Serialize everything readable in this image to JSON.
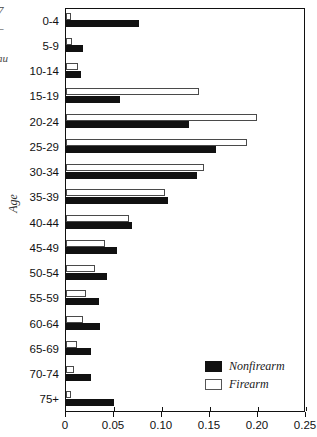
{
  "chart_data": {
    "type": "bar",
    "orientation": "horizontal",
    "title": "",
    "xlabel": "",
    "ylabel": "Age",
    "xlim": [
      0,
      0.25
    ],
    "xticks": [
      "0",
      "0.05",
      "0.10",
      "0.15",
      "0.20",
      "0.25"
    ],
    "xtick_values": [
      0,
      0.05,
      0.1,
      0.15,
      0.2,
      0.25
    ],
    "grid": false,
    "legend_position": "bottom-right",
    "categories": [
      "0-4",
      "5-9",
      "10-14",
      "15-19",
      "20-24",
      "25-29",
      "30-34",
      "35-39",
      "40-44",
      "45-49",
      "50-54",
      "55-59",
      "60-64",
      "65-69",
      "70-74",
      "75+"
    ],
    "series": [
      {
        "name": "Nonfirearm",
        "color": "#111111",
        "values": [
          0.076,
          0.018,
          0.016,
          0.056,
          0.128,
          0.156,
          0.136,
          0.106,
          0.069,
          0.053,
          0.043,
          0.034,
          0.035,
          0.026,
          0.026,
          0.05
        ]
      },
      {
        "name": "Firearm",
        "color": "#ffffff",
        "values": [
          0.005,
          0.006,
          0.013,
          0.139,
          0.199,
          0.189,
          0.144,
          0.103,
          0.066,
          0.041,
          0.03,
          0.021,
          0.018,
          0.011,
          0.008,
          0.005
        ]
      }
    ]
  },
  "legend": {
    "items": [
      {
        "label": "Nonfirearm"
      },
      {
        "label": "Firearm"
      }
    ]
  },
  "axis": {
    "y_title": "Age"
  },
  "edge_artifacts": {
    "a": "7",
    "b": "–",
    "c": "au"
  }
}
